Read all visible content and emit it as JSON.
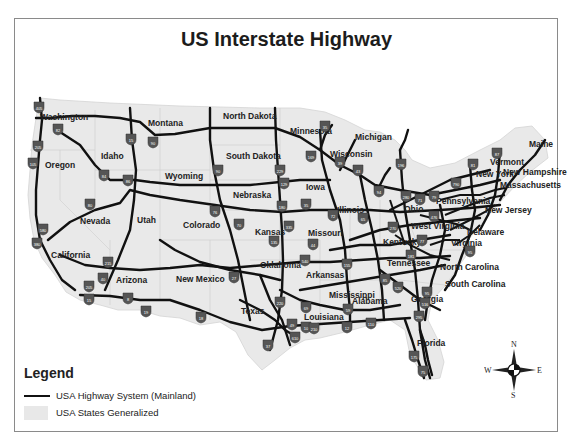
{
  "title": "US Interstate Highway",
  "legend": {
    "title": "Legend",
    "items": [
      {
        "label": "USA Highway System (Mainland)",
        "symbol": "line",
        "color": "#111111"
      },
      {
        "label": "USA States Generalized",
        "symbol": "fill",
        "color": "#e8e8e8"
      }
    ]
  },
  "compass": {
    "n": "N",
    "s": "S",
    "e": "E",
    "w": "W"
  },
  "colors": {
    "land": "#e9e9e9",
    "highway": "#111111",
    "shield": "#555555",
    "frame": "#8a8a8a"
  },
  "states": [
    {
      "name": "Washington",
      "x": 40,
      "y": 120
    },
    {
      "name": "Oregon",
      "x": 45,
      "y": 168
    },
    {
      "name": "Idaho",
      "x": 101,
      "y": 159
    },
    {
      "name": "Montana",
      "x": 148,
      "y": 126
    },
    {
      "name": "North Dakota",
      "x": 223,
      "y": 119
    },
    {
      "name": "Minnesota",
      "x": 290,
      "y": 134
    },
    {
      "name": "Michigan",
      "x": 355,
      "y": 140
    },
    {
      "name": "Wisconsin",
      "x": 330,
      "y": 157
    },
    {
      "name": "South Dakota",
      "x": 226,
      "y": 159
    },
    {
      "name": "Wyoming",
      "x": 165,
      "y": 179
    },
    {
      "name": "Nebraska",
      "x": 233,
      "y": 198
    },
    {
      "name": "Iowa",
      "x": 306,
      "y": 190
    },
    {
      "name": "Illinois",
      "x": 337,
      "y": 213
    },
    {
      "name": "Nevada",
      "x": 80,
      "y": 224
    },
    {
      "name": "Utah",
      "x": 137,
      "y": 223
    },
    {
      "name": "Colorado",
      "x": 183,
      "y": 228
    },
    {
      "name": "Kansas",
      "x": 255,
      "y": 235
    },
    {
      "name": "Missouri",
      "x": 308,
      "y": 236
    },
    {
      "name": "Ohio",
      "x": 404,
      "y": 212
    },
    {
      "name": "Pennsylvania",
      "x": 436,
      "y": 204
    },
    {
      "name": "New York",
      "x": 476,
      "y": 177
    },
    {
      "name": "Vermont",
      "x": 490,
      "y": 165
    },
    {
      "name": "New Hampshire",
      "x": 503,
      "y": 175
    },
    {
      "name": "Maine",
      "x": 529,
      "y": 147
    },
    {
      "name": "Massachusetts",
      "x": 500,
      "y": 188
    },
    {
      "name": "New Jersey",
      "x": 485,
      "y": 213
    },
    {
      "name": "West Virginia",
      "x": 411,
      "y": 229
    },
    {
      "name": "Delaware",
      "x": 467,
      "y": 235
    },
    {
      "name": "Virginia",
      "x": 451,
      "y": 246
    },
    {
      "name": "Kentucky",
      "x": 383,
      "y": 245
    },
    {
      "name": "California",
      "x": 51,
      "y": 258
    },
    {
      "name": "Oklahoma",
      "x": 260,
      "y": 268
    },
    {
      "name": "Arkansas",
      "x": 306,
      "y": 278
    },
    {
      "name": "Tennessee",
      "x": 387,
      "y": 266
    },
    {
      "name": "North Carolina",
      "x": 440,
      "y": 270
    },
    {
      "name": "Arizona",
      "x": 116,
      "y": 283
    },
    {
      "name": "New Mexico",
      "x": 176,
      "y": 282
    },
    {
      "name": "South Carolina",
      "x": 445,
      "y": 287
    },
    {
      "name": "Mississippi",
      "x": 329,
      "y": 298
    },
    {
      "name": "Alabama",
      "x": 352,
      "y": 304
    },
    {
      "name": "Georgia",
      "x": 411,
      "y": 302
    },
    {
      "name": "Texas",
      "x": 241,
      "y": 314
    },
    {
      "name": "Louisiana",
      "x": 304,
      "y": 320
    },
    {
      "name": "Florida",
      "x": 417,
      "y": 346
    }
  ],
  "shields": [
    {
      "num": "405",
      "x": 39,
      "y": 107
    },
    {
      "num": "82",
      "x": 58,
      "y": 129
    },
    {
      "num": "205",
      "x": 38,
      "y": 146
    },
    {
      "num": "105",
      "x": 33,
      "y": 163
    },
    {
      "num": "15",
      "x": 131,
      "y": 139
    },
    {
      "num": "90",
      "x": 153,
      "y": 142
    },
    {
      "num": "84",
      "x": 104,
      "y": 175
    },
    {
      "num": "86",
      "x": 128,
      "y": 180
    },
    {
      "num": "35",
      "x": 325,
      "y": 126
    },
    {
      "name": "",
      "num": "90",
      "x": 218,
      "y": 170
    },
    {
      "num": "229",
      "x": 280,
      "y": 170
    },
    {
      "num": "129",
      "x": 284,
      "y": 183
    },
    {
      "num": "169",
      "x": 311,
      "y": 156
    },
    {
      "num": "39",
      "x": 340,
      "y": 162
    },
    {
      "num": "43",
      "x": 358,
      "y": 170
    },
    {
      "num": "196",
      "x": 401,
      "y": 164
    },
    {
      "num": "81",
      "x": 473,
      "y": 164
    },
    {
      "num": "87",
      "x": 497,
      "y": 153
    },
    {
      "num": "790",
      "x": 456,
      "y": 183
    },
    {
      "num": "94",
      "x": 379,
      "y": 191
    },
    {
      "num": "280",
      "x": 406,
      "y": 196
    },
    {
      "num": "71",
      "x": 420,
      "y": 199
    },
    {
      "num": "79",
      "x": 434,
      "y": 196
    },
    {
      "num": "80",
      "x": 90,
      "y": 204
    },
    {
      "num": "580",
      "x": 43,
      "y": 229
    },
    {
      "num": "380",
      "x": 37,
      "y": 243
    },
    {
      "num": "215",
      "x": 108,
      "y": 262
    },
    {
      "num": "40",
      "x": 103,
      "y": 278
    },
    {
      "num": "205",
      "x": 89,
      "y": 286
    },
    {
      "num": "15",
      "x": 89,
      "y": 299
    },
    {
      "num": "8",
      "x": 128,
      "y": 298
    },
    {
      "num": "19",
      "x": 146,
      "y": 311
    },
    {
      "num": "76",
      "x": 215,
      "y": 211
    },
    {
      "num": "180",
      "x": 282,
      "y": 206
    },
    {
      "num": "35",
      "x": 306,
      "y": 204
    },
    {
      "num": "70",
      "x": 239,
      "y": 224
    },
    {
      "num": "335",
      "x": 289,
      "y": 226
    },
    {
      "num": "72",
      "x": 333,
      "y": 215
    },
    {
      "num": "135",
      "x": 274,
      "y": 241
    },
    {
      "num": "44",
      "x": 313,
      "y": 244
    },
    {
      "num": "540",
      "x": 305,
      "y": 260
    },
    {
      "num": "155",
      "x": 347,
      "y": 264
    },
    {
      "num": "27",
      "x": 234,
      "y": 277
    },
    {
      "num": "18",
      "x": 201,
      "y": 317
    },
    {
      "num": "220",
      "x": 280,
      "y": 302
    },
    {
      "num": "69",
      "x": 306,
      "y": 307
    },
    {
      "num": "49",
      "x": 292,
      "y": 324
    },
    {
      "num": "10",
      "x": 306,
      "y": 327
    },
    {
      "num": "210",
      "x": 314,
      "y": 328
    },
    {
      "num": "610",
      "x": 295,
      "y": 337
    },
    {
      "num": "37",
      "x": 268,
      "y": 345
    },
    {
      "num": "12",
      "x": 347,
      "y": 327
    },
    {
      "num": "110",
      "x": 371,
      "y": 323
    },
    {
      "num": "59",
      "x": 348,
      "y": 309
    },
    {
      "num": "65",
      "x": 363,
      "y": 218
    },
    {
      "num": "270",
      "x": 393,
      "y": 227
    },
    {
      "num": "77",
      "x": 422,
      "y": 240
    },
    {
      "num": "181",
      "x": 411,
      "y": 255
    },
    {
      "num": "95",
      "x": 470,
      "y": 251
    },
    {
      "num": "85",
      "x": 385,
      "y": 279
    },
    {
      "num": "520",
      "x": 398,
      "y": 287
    },
    {
      "num": "95",
      "x": 427,
      "y": 292
    },
    {
      "num": "516",
      "x": 425,
      "y": 303
    },
    {
      "num": "295",
      "x": 419,
      "y": 316
    },
    {
      "num": "175",
      "x": 414,
      "y": 356
    },
    {
      "num": "75",
      "x": 423,
      "y": 371
    },
    {
      "num": "476",
      "x": 434,
      "y": 216
    }
  ]
}
